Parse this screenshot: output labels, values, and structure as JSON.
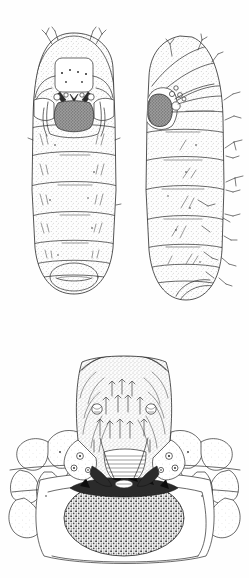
{
  "figure": {
    "type": "scientific-line-illustration",
    "medium": "stippled pen-and-ink drawing",
    "background_color": "#fefefe",
    "ink_color": "#2a2a2a",
    "canvas": {
      "width": 249,
      "height": 578
    },
    "panels": [
      {
        "id": "panel-dorsal-larva",
        "name": "dorsal-view-larva",
        "label": "",
        "position": {
          "x": 28,
          "y": 33,
          "width": 92,
          "height": 262
        },
        "description": "Whole larva seen from above (dorsal). Rounded head capsule at top, eleven stippled body segments tapering to a rounded caudal end.",
        "features": {
          "head_shield_color": "#f2f2f2",
          "mouth_mask_color": "#4a4a4a",
          "segment_count": 11,
          "setae_count": 6,
          "antenna_pairs": 2
        }
      },
      {
        "id": "panel-lateral-larva",
        "name": "lateral-view-larva",
        "label": "",
        "position": {
          "x": 138,
          "y": 33,
          "width": 92,
          "height": 270
        },
        "description": "Whole larva seen from the side (lateral). Head capsule with dark round eye-spot at left, segments bearing lateral setae along the right margin.",
        "features": {
          "eye_spot_color": "#595959",
          "segment_count": 11,
          "lateral_setae_count": 11
        }
      },
      {
        "id": "panel-head-detail",
        "name": "ventral-head-mouthparts-detail",
        "label": "",
        "position": {
          "x": 18,
          "y": 352,
          "width": 214,
          "height": 210
        },
        "description": "Enlarged ventral view of head capsule and mouthparts: labrum with rows of spiniform setae, paired sensory pits, dark sclerotised mandibles, a black toothed mouth margin and a coarsely granulate hypopharyngeal plate, flanked by polygonal lateral lobes.",
        "features": {
          "seta_count": 24,
          "sensory_pit_count": 2,
          "lateral_lobe_count": 10,
          "mandible_color": "#151515",
          "granulate_plate_pattern": "coarse-stipple",
          "black_band_color": "#141414"
        }
      }
    ],
    "annotations": [],
    "scale_bar": null,
    "caption": ""
  }
}
